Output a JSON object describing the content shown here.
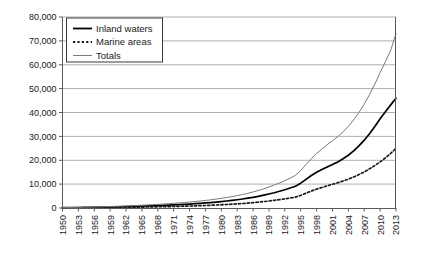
{
  "chart_data": {
    "type": "line",
    "title": "",
    "xlabel": "",
    "ylabel": "",
    "ylim": [
      0,
      80000
    ],
    "yticks": [
      0,
      10000,
      20000,
      30000,
      40000,
      50000,
      60000,
      70000,
      80000
    ],
    "ytick_labels": [
      "0",
      "10,000",
      "20,000",
      "30,000",
      "40,000",
      "50,000",
      "60,000",
      "70,000",
      "80,000"
    ],
    "grid": true,
    "legend_position": "top-left",
    "xtick_labels": [
      "1950",
      "1953",
      "1956",
      "1959",
      "1962",
      "1965",
      "1968",
      "1971",
      "1974",
      "1977",
      "1980",
      "1983",
      "1986",
      "1989",
      "1992",
      "1995",
      "1998",
      "2001",
      "2004",
      "2007",
      "2010",
      "2013"
    ],
    "x": [
      1950,
      1951,
      1952,
      1953,
      1954,
      1955,
      1956,
      1957,
      1958,
      1959,
      1960,
      1961,
      1962,
      1963,
      1964,
      1965,
      1966,
      1967,
      1968,
      1969,
      1970,
      1971,
      1972,
      1973,
      1974,
      1975,
      1976,
      1977,
      1978,
      1979,
      1980,
      1981,
      1982,
      1983,
      1984,
      1985,
      1986,
      1987,
      1988,
      1989,
      1990,
      1991,
      1992,
      1993,
      1994,
      1995,
      1996,
      1997,
      1998,
      1999,
      2000,
      2001,
      2002,
      2003,
      2004,
      2005,
      2006,
      2007,
      2008,
      2009,
      2010,
      2011,
      2012,
      2013
    ],
    "series": [
      {
        "name": "Inland waters",
        "style": "solid-thick-black",
        "color": "#000000",
        "values": [
          120,
          140,
          165,
          190,
          220,
          255,
          290,
          330,
          375,
          420,
          470,
          525,
          580,
          640,
          705,
          775,
          850,
          930,
          1015,
          1105,
          1200,
          1300,
          1410,
          1530,
          1660,
          1800,
          1950,
          2110,
          2290,
          2490,
          2700,
          2930,
          3180,
          3450,
          3760,
          4100,
          4480,
          4900,
          5360,
          5860,
          6400,
          7000,
          7650,
          8350,
          9100,
          10400,
          12000,
          13600,
          15000,
          16100,
          17200,
          18200,
          19300,
          20600,
          22100,
          23900,
          26000,
          28400,
          31100,
          34100,
          37400,
          40300,
          43200,
          46000
        ]
      },
      {
        "name": "Marine areas",
        "style": "dotted",
        "color": "#1a1a1a",
        "values": [
          60,
          70,
          82,
          95,
          110,
          127,
          145,
          165,
          187,
          210,
          235,
          262,
          290,
          320,
          352,
          387,
          425,
          465,
          508,
          553,
          600,
          650,
          705,
          765,
          830,
          900,
          975,
          1055,
          1145,
          1245,
          1350,
          1465,
          1590,
          1725,
          1880,
          2050,
          2240,
          2450,
          2680,
          2930,
          3200,
          3500,
          3830,
          4180,
          4560,
          5300,
          6200,
          7100,
          7900,
          8600,
          9300,
          9950,
          10600,
          11300,
          12100,
          13000,
          14000,
          15100,
          16400,
          17800,
          19300,
          21000,
          22900,
          25000
        ]
      },
      {
        "name": "Totals",
        "style": "solid-thin-gray",
        "color": "#7a7a7a",
        "values": [
          180,
          210,
          247,
          285,
          330,
          382,
          435,
          495,
          562,
          630,
          705,
          787,
          870,
          960,
          1057,
          1162,
          1275,
          1395,
          1523,
          1658,
          1800,
          1950,
          2115,
          2295,
          2490,
          2700,
          2925,
          3165,
          3435,
          3735,
          4050,
          4395,
          4770,
          5175,
          5640,
          6150,
          6720,
          7350,
          8040,
          8790,
          9600,
          10500,
          11480,
          12530,
          13660,
          15700,
          18200,
          20700,
          22900,
          24700,
          26500,
          28150,
          29900,
          31900,
          34200,
          36900,
          40000,
          43500,
          47500,
          51900,
          56700,
          61300,
          66100,
          73000
        ]
      }
    ]
  },
  "legend": {
    "items": [
      {
        "label": "Inland waters"
      },
      {
        "label": "Marine areas"
      },
      {
        "label": "Totals"
      }
    ]
  }
}
